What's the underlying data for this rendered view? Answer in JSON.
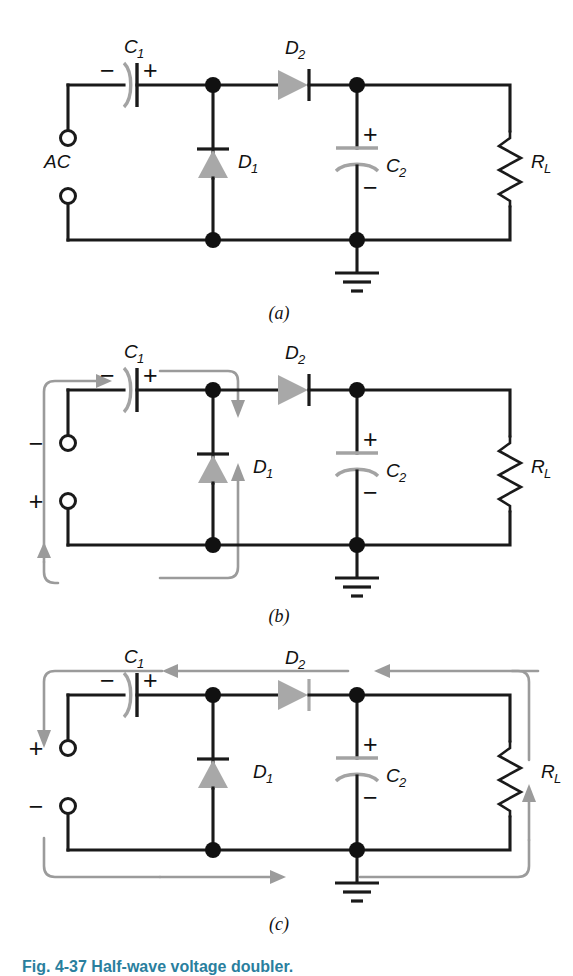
{
  "figure": {
    "caption": "Fig. 4-37  Half-wave voltage doubler.",
    "caption_color": "#2a7f9e",
    "background": "#ffffff",
    "ink_color": "#1a1a1a",
    "accent_gray": "#a8a8a8",
    "flow_gray": "#9b9b9b"
  },
  "panels": [
    {
      "id": "a",
      "label": "(a)",
      "source_label": "AC",
      "components": {
        "c1": {
          "label": "C",
          "sub": "1",
          "minus": "−",
          "plus": "+"
        },
        "d1": {
          "label": "D",
          "sub": "1",
          "direction": "up"
        },
        "d2": {
          "label": "D",
          "sub": "2",
          "direction": "right"
        },
        "c2": {
          "label": "C",
          "sub": "2",
          "plus": "+",
          "minus": "−"
        },
        "rl": {
          "label": "R",
          "sub": "L"
        },
        "ground": {
          "name": "ground-symbol"
        }
      },
      "flow_arrows": []
    },
    {
      "id": "b",
      "label": "(b)",
      "source_label": "",
      "terminals": {
        "top": "−",
        "bottom": "+"
      },
      "components": {
        "c1": {
          "label": "C",
          "sub": "1",
          "minus": "−",
          "plus": "+"
        },
        "d1": {
          "label": "D",
          "sub": "1",
          "direction": "up"
        },
        "d2": {
          "label": "D",
          "sub": "2",
          "direction": "right"
        },
        "c2": {
          "label": "C",
          "sub": "2",
          "plus": "+",
          "minus": "−"
        },
        "rl": {
          "label": "R",
          "sub": "L"
        },
        "ground": {
          "name": "ground-symbol"
        }
      },
      "flow_arrows": [
        {
          "name": "source-loop-arrow",
          "description": "current up left side and right through C1"
        },
        {
          "name": "d1-charge-loop-arrow",
          "description": "current down through D1 and back to source"
        }
      ]
    },
    {
      "id": "c",
      "label": "(c)",
      "source_label": "",
      "terminals": {
        "top": "+",
        "bottom": "−"
      },
      "components": {
        "c1": {
          "label": "C",
          "sub": "1",
          "minus": "−",
          "plus": "+"
        },
        "d1": {
          "label": "D",
          "sub": "1",
          "direction": "up"
        },
        "d2": {
          "label": "D",
          "sub": "2",
          "direction": "right"
        },
        "c2": {
          "label": "C",
          "sub": "2",
          "plus": "+",
          "minus": "−"
        },
        "rl": {
          "label": "R",
          "sub": "L"
        },
        "ground": {
          "name": "ground-symbol"
        }
      },
      "flow_arrows": [
        {
          "name": "top-leftward-arrow",
          "description": "current flows leftward across top through D2"
        },
        {
          "name": "left-down-arrow",
          "description": "current flows down outside left edge"
        },
        {
          "name": "bottom-rightward-arrow",
          "description": "current flows rightward along bottom rail"
        },
        {
          "name": "right-up-arrow",
          "description": "current flows up through R_L branch"
        }
      ]
    }
  ]
}
